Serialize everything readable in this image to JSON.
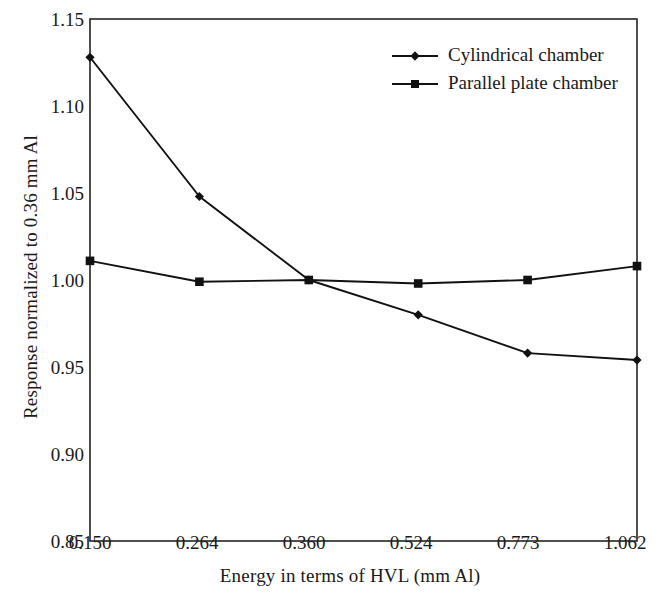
{
  "chart_data": {
    "type": "line",
    "title": "",
    "xlabel": "Energy in terms of HVL (mm Al)",
    "ylabel": "Response normalized to 0.36 mm Al",
    "categories": [
      "0.150",
      "0.264",
      "0.360",
      "0.524",
      "0.773",
      "1.062"
    ],
    "ylim": [
      0.85,
      1.15
    ],
    "yticks": [
      "0.85",
      "0.90",
      "0.95",
      "1.00",
      "1.05",
      "1.10",
      "1.15"
    ],
    "ytick_values": [
      0.85,
      0.9,
      0.95,
      1.0,
      1.05,
      1.1,
      1.15
    ],
    "grid": false,
    "legend_position": "top-right",
    "series": [
      {
        "name": "Cylindrical chamber",
        "marker": "diamond",
        "color": "#111111",
        "values": [
          1.128,
          1.048,
          1.0,
          0.98,
          0.958,
          0.954
        ]
      },
      {
        "name": "Parallel plate chamber",
        "marker": "square",
        "color": "#111111",
        "values": [
          1.011,
          0.999,
          1.0,
          0.998,
          1.0,
          1.008
        ]
      }
    ]
  },
  "legend": {
    "items": [
      {
        "label": "Cylindrical chamber",
        "marker": "diamond-marker-icon"
      },
      {
        "label": "Parallel plate chamber",
        "marker": "square-marker-icon"
      }
    ]
  },
  "axes": {
    "y_title": "Response normalized to 0.36 mm Al",
    "x_title": "Energy in terms of HVL (mm Al)",
    "y_labels": [
      "1.15",
      "1.10",
      "1.05",
      "1.00",
      "0.95",
      "0.90",
      "0.85"
    ],
    "x_labels": [
      "0.150",
      "0.264",
      "0.360",
      "0.524",
      "0.773",
      "1.062"
    ]
  },
  "style": {
    "line_color": "#111111",
    "frame_color": "#222222",
    "background": "#ffffff"
  }
}
